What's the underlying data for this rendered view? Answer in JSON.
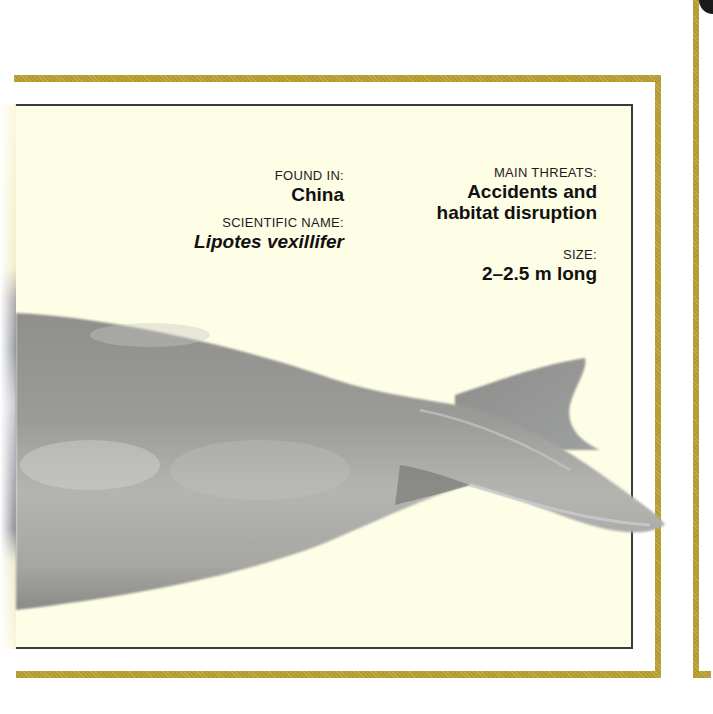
{
  "fact_card": {
    "found_in": {
      "label": "FOUND IN:",
      "value": "China"
    },
    "scientific_name": {
      "label": "SCIENTIFIC NAME:",
      "value": "Lipotes vexillifer"
    },
    "main_threats": {
      "label": "MAIN THREATS:",
      "value_line1": "Accidents and",
      "value_line2": "habitat disruption"
    },
    "size": {
      "label": "SIZE:",
      "value": "2–2.5 m long"
    }
  },
  "illustration": {
    "subject": "dolphin-tail-flukes"
  },
  "colors": {
    "frame_gold": "#b39a2a",
    "panel_background": "#fefde6",
    "panel_border": "#3a3a3a",
    "text": "#111111",
    "animal_gray": "#8e8e8a"
  }
}
